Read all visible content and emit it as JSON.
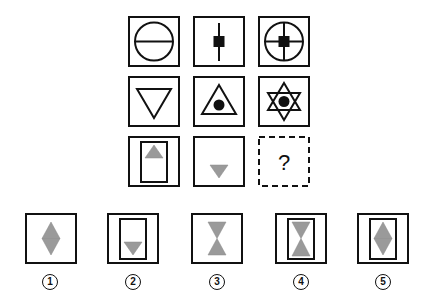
{
  "puzzle": {
    "grid": {
      "rows": [
        {
          "cells": [
            {
              "id": "r1c1",
              "description": "circle with horizontal line",
              "x": 128,
              "y": 16
            },
            {
              "id": "r1c2",
              "description": "vertical line with black square",
              "x": 193,
              "y": 16
            },
            {
              "id": "r1c3",
              "description": "circle with cross and black square",
              "x": 258,
              "y": 16
            }
          ]
        },
        {
          "cells": [
            {
              "id": "r2c1",
              "description": "downward triangle outline",
              "x": 128,
              "y": 76
            },
            {
              "id": "r2c2",
              "description": "upward triangle with black dot",
              "x": 193,
              "y": 76
            },
            {
              "id": "r2c3",
              "description": "six-pointed star with black dot",
              "x": 258,
              "y": 76
            }
          ]
        },
        {
          "cells": [
            {
              "id": "r3c1",
              "description": "inner rectangle with gray upward triangle at top",
              "x": 128,
              "y": 136
            },
            {
              "id": "r3c2",
              "description": "gray downward triangle at bottom",
              "x": 193,
              "y": 136
            },
            {
              "id": "r3c3",
              "description": "unknown",
              "x": 258,
              "y": 136,
              "placeholder": "?"
            }
          ]
        }
      ]
    },
    "options": [
      {
        "number": "1",
        "label": "①",
        "description": "gray diamond (two triangles base-to-base)",
        "x": 25,
        "y": 213
      },
      {
        "number": "2",
        "label": "②",
        "description": "inner rectangle with gray downward triangle at bottom",
        "x": 107,
        "y": 213
      },
      {
        "number": "3",
        "label": "③",
        "description": "gray hourglass (two triangles tip-to-tip)",
        "x": 191,
        "y": 213
      },
      {
        "number": "4",
        "label": "④",
        "description": "inner rectangle with gray hourglass",
        "x": 275,
        "y": 213
      },
      {
        "number": "5",
        "label": "⑤",
        "description": "inner rectangle with gray diamond",
        "x": 357,
        "y": 213
      }
    ],
    "colors": {
      "stroke": "#111111",
      "gray_fill": "#9a9a9a",
      "background": "#ffffff"
    }
  }
}
